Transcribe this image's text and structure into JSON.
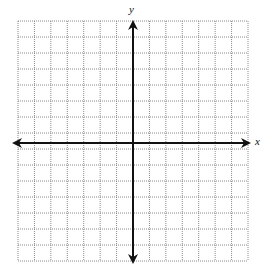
{
  "diagram": {
    "type": "coordinate-plane",
    "grid": {
      "left": 18,
      "top": 21,
      "right": 248,
      "bottom": 261,
      "columns": 14,
      "rows": 15,
      "line_color": "#8a8a8a",
      "line_style": "dotted"
    },
    "axes": {
      "x_axis_y": 143,
      "y_axis_x": 133,
      "x_from": 12,
      "x_to": 251,
      "y_from": 20,
      "y_to": 264,
      "color": "#111111",
      "x_label": "x",
      "y_label": "y"
    }
  }
}
